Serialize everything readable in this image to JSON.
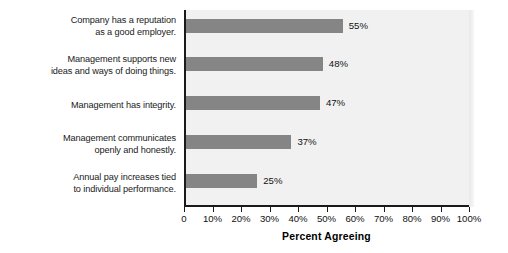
{
  "chart_data": {
    "type": "bar",
    "orientation": "horizontal",
    "title": "",
    "xlabel": "Percent Agreeing",
    "ylabel": "",
    "xlim": [
      0,
      100
    ],
    "grid": false,
    "legend": null,
    "categories": [
      "Company has a reputation\nas a good employer.",
      "Management supports new\nideas and ways of doing things.",
      "Management has integrity.",
      "Management communicates\nopenly and honestly.",
      "Annual pay increases tied\nto individual performance."
    ],
    "values": [
      55,
      48,
      47,
      37,
      25
    ],
    "value_labels": [
      "55%",
      "48%",
      "47%",
      "37%",
      "25%"
    ],
    "xticks": [
      0,
      10,
      20,
      30,
      40,
      50,
      60,
      70,
      80,
      90,
      100
    ],
    "xtick_labels": [
      "0",
      "10%",
      "20%",
      "30%",
      "40%",
      "50%",
      "60%",
      "70%",
      "80%",
      "90%",
      "100%"
    ],
    "colors": {
      "bar": "#858585",
      "plot_background": "#f1f1f1",
      "axis": "#1a1a1a",
      "text": "#111111",
      "page_background": "#ffffff"
    }
  },
  "categories_display": [
    {
      "line1": "Company has a reputation",
      "line2": "as a good employer."
    },
    {
      "line1": "Management supports new",
      "line2": "ideas and ways of doing things."
    },
    {
      "line1": "Management has integrity.",
      "line2": ""
    },
    {
      "line1": "Management communicates",
      "line2": "openly and honestly."
    },
    {
      "line1": "Annual pay increases tied",
      "line2": "to individual performance."
    }
  ]
}
